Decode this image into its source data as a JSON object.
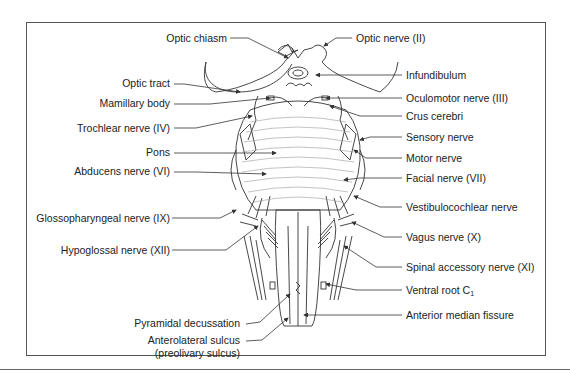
{
  "figure": {
    "colors": {
      "line": "#333333",
      "frame": "#555555",
      "pons_lines": "#9a9a9a",
      "background": "#ffffff"
    },
    "labels_left": [
      {
        "id": "optic-chiasm",
        "text": "Optic chiasm"
      },
      {
        "id": "optic-tract",
        "text": "Optic tract"
      },
      {
        "id": "mamillary-body",
        "text": "Mamillary body"
      },
      {
        "id": "trochlear-nerve",
        "text": "Trochlear nerve (IV)"
      },
      {
        "id": "pons",
        "text": "Pons"
      },
      {
        "id": "abducens-nerve",
        "text": "Abducens nerve (VI)"
      },
      {
        "id": "glossopharyngeal-nerve",
        "text": "Glossopharyngeal nerve (IX)"
      },
      {
        "id": "hypoglossal-nerve",
        "text": "Hypoglossal nerve (XII)"
      },
      {
        "id": "pyramidal-decussation",
        "text": "Pyramidal decussation"
      },
      {
        "id": "anterolateral-sulcus",
        "text": "Anterolateral sulcus"
      },
      {
        "id": "preolivary-sulcus",
        "text": "(preolivary sulcus)"
      }
    ],
    "labels_right": [
      {
        "id": "optic-nerve",
        "text": "Optic nerve (II)"
      },
      {
        "id": "infundibulum",
        "text": "Infundibulum"
      },
      {
        "id": "oculomotor-nerve",
        "text": "Oculomotor nerve (III)"
      },
      {
        "id": "crus-cerebri",
        "text": "Crus cerebri"
      },
      {
        "id": "sensory-nerve",
        "text": "Sensory nerve"
      },
      {
        "id": "motor-nerve",
        "text": "Motor nerve"
      },
      {
        "id": "facial-nerve",
        "text": "Facial nerve (VII)"
      },
      {
        "id": "vestibulocochlear-nerve",
        "text": "Vestibulocochlear nerve"
      },
      {
        "id": "vagus-nerve",
        "text": "Vagus nerve (X)"
      },
      {
        "id": "spinal-accessory-nerve",
        "text": "Spinal accessory nerve (XI)"
      },
      {
        "id": "ventral-root",
        "text": "Ventral root C",
        "sub": "1"
      },
      {
        "id": "anterior-median-fissure",
        "text": "Anterior median fissure"
      }
    ]
  }
}
